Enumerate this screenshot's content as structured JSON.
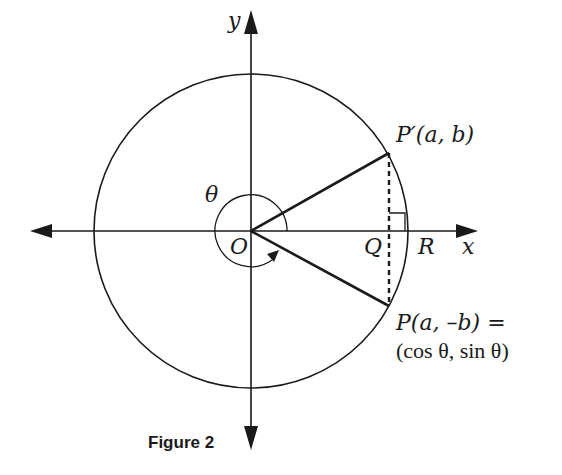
{
  "figure": {
    "caption": "Figure 2",
    "colors": {
      "ink": "#1a1a1a",
      "background": "#ffffff"
    },
    "axes": {
      "x_label": "x",
      "y_label": "y"
    },
    "points": {
      "origin": "O",
      "q": "Q",
      "r": "R",
      "p_prime": "P′(a, b)",
      "p_line1": "P(a, –b) =",
      "p_line2": "(cos θ, sin θ)"
    },
    "angle_label": "θ"
  }
}
